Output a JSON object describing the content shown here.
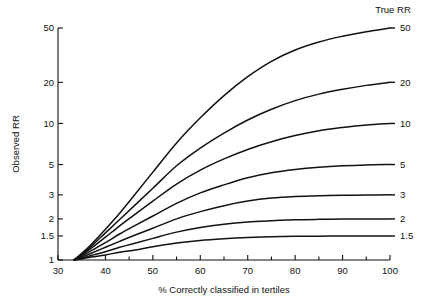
{
  "chart_data": {
    "type": "line",
    "title": "",
    "xlabel": "% Correctly classified in tertiles",
    "ylabel": "Observed RR",
    "legend_title": "True RR",
    "legend_position": "right",
    "grid": false,
    "yscale": "log",
    "xlim": [
      30,
      100
    ],
    "ylim": [
      1,
      50
    ],
    "xticks": [
      30,
      40,
      50,
      60,
      70,
      80,
      90,
      100
    ],
    "xtick_labels": [
      "30",
      "40",
      "50",
      "60",
      "70",
      "80",
      "90",
      "100"
    ],
    "xminor_ticks": [
      35,
      45,
      55,
      65,
      75,
      85,
      95
    ],
    "yticks": [
      1,
      1.5,
      2,
      3,
      5,
      10,
      20,
      50
    ],
    "ytick_labels": [
      "1",
      "1.5",
      "2",
      "3",
      "5",
      "10",
      "20",
      "50"
    ],
    "x": [
      33.34,
      35,
      37,
      40,
      43,
      46,
      50,
      55,
      60,
      65,
      70,
      75,
      80,
      85,
      90,
      95,
      100
    ],
    "series": [
      {
        "name": "50",
        "label": "50",
        "true_rr": 50,
        "values": [
          1.0,
          1.12,
          1.3,
          1.68,
          2.2,
          2.95,
          4.4,
          7.2,
          11.0,
          16.0,
          22.0,
          28.5,
          34.5,
          39.5,
          43.5,
          47.0,
          50.0
        ]
      },
      {
        "name": "20",
        "label": "20",
        "true_rr": 20,
        "values": [
          1.0,
          1.1,
          1.26,
          1.58,
          1.98,
          2.48,
          3.35,
          4.9,
          6.6,
          8.5,
          10.6,
          12.7,
          14.7,
          16.4,
          17.8,
          19.0,
          20.0
        ]
      },
      {
        "name": "10",
        "label": "10",
        "true_rr": 10,
        "values": [
          1.0,
          1.09,
          1.22,
          1.47,
          1.78,
          2.13,
          2.7,
          3.6,
          4.55,
          5.5,
          6.45,
          7.35,
          8.15,
          8.85,
          9.35,
          9.75,
          10.0
        ]
      },
      {
        "name": "5",
        "label": "5",
        "true_rr": 5,
        "values": [
          1.0,
          1.07,
          1.17,
          1.34,
          1.55,
          1.77,
          2.1,
          2.6,
          3.1,
          3.55,
          4.0,
          4.35,
          4.6,
          4.78,
          4.9,
          4.97,
          5.0
        ]
      },
      {
        "name": "3",
        "label": "3",
        "true_rr": 3,
        "values": [
          1.0,
          1.05,
          1.12,
          1.24,
          1.37,
          1.51,
          1.71,
          2.0,
          2.26,
          2.5,
          2.7,
          2.84,
          2.92,
          2.96,
          2.98,
          2.99,
          3.0
        ]
      },
      {
        "name": "2",
        "label": "2",
        "true_rr": 2,
        "values": [
          1.0,
          1.03,
          1.08,
          1.15,
          1.24,
          1.32,
          1.44,
          1.6,
          1.73,
          1.83,
          1.9,
          1.94,
          1.97,
          1.985,
          1.995,
          2.0,
          2.0
        ]
      },
      {
        "name": "1.5",
        "label": "1.5",
        "true_rr": 1.5,
        "values": [
          1.0,
          1.02,
          1.05,
          1.09,
          1.14,
          1.18,
          1.25,
          1.33,
          1.39,
          1.43,
          1.46,
          1.48,
          1.49,
          1.495,
          1.5,
          1.5,
          1.5
        ]
      }
    ]
  },
  "layout": {
    "plot_left": 58,
    "plot_right": 390,
    "plot_top": 28,
    "plot_bottom": 260,
    "legend_title_x": 393,
    "legend_title_y": 13,
    "label_x": 400,
    "xlabel_x": 224,
    "xlabel_y": 293,
    "ylabel_x": 19,
    "ylabel_y": 144
  },
  "colors": {
    "line": "#111111",
    "axis": "#111111",
    "background": "#ffffff"
  }
}
